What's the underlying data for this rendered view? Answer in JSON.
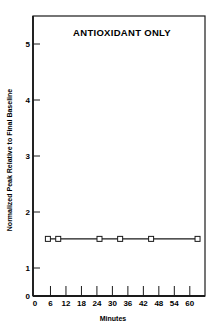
{
  "chart_data": {
    "type": "line",
    "title": "ANTIOXIDANT ONLY",
    "xlabel": "Minutes",
    "ylabel": "Normalized Peak Relative to Final Baseline",
    "x_ticks": [
      0,
      6,
      12,
      18,
      24,
      30,
      36,
      42,
      48,
      54,
      60
    ],
    "y_ticks": [
      0,
      1,
      2,
      3,
      4,
      5
    ],
    "xlim": [
      0,
      66
    ],
    "ylim": [
      0,
      5.5
    ],
    "grid": false,
    "legend": null,
    "series": [
      {
        "name": "Antioxidant only",
        "marker": "open-square",
        "x": [
          5,
          9,
          25,
          33,
          45,
          63
        ],
        "y": [
          1.52,
          1.52,
          1.52,
          1.52,
          1.52,
          1.52
        ]
      }
    ]
  },
  "colors": {
    "ink": "#1a1a1a",
    "background": "#ffffff"
  }
}
